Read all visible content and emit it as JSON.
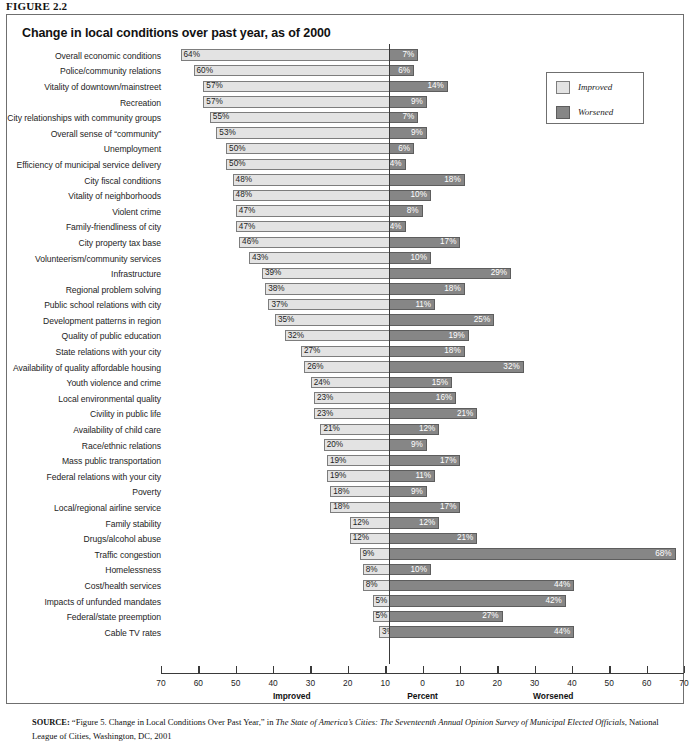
{
  "figure_label": "FIGURE 2.2",
  "chart_title": "Change in local conditions over past year, as of 2000",
  "legend": {
    "improved_label": "Improved",
    "worsened_label": "Worsened",
    "improved_color": "#e3e3e3",
    "worsened_color": "#868686"
  },
  "axis": {
    "ticks": [
      "70",
      "60",
      "50",
      "40",
      "30",
      "20",
      "10",
      "0",
      "10",
      "20",
      "30",
      "40",
      "50",
      "60",
      "70"
    ],
    "left_caption": "Improved",
    "center_caption": "Percent",
    "right_caption": "Worsened",
    "min": -70,
    "max": 70
  },
  "source": {
    "prefix": "SOURCE:",
    "part1": " “Figure 5. Change in Local Conditions Over Past Year,” in ",
    "italic1": "The State of America’s Cities: The Seventeenth Annual Opinion Survey of Municipal Elected Officials",
    "part2": ", National League of Cities, Washington, DC, 2001"
  },
  "chart_data": {
    "type": "bar",
    "title": "Change in local conditions over past year, as of 2000",
    "xlabel": "Percent",
    "ylabel": "",
    "xlim": [
      -70,
      70
    ],
    "grid": false,
    "legend_position": "top-right",
    "orientation": "horizontal",
    "diverging": true,
    "categories": [
      "Overall economic conditions",
      "Police/community relations",
      "Vitality of downtown/mainstreet",
      "Recreation",
      "City relationships with community groups",
      "Overall sense of “community”",
      "Unemployment",
      "Efficiency of municipal service delivery",
      "City fiscal conditions",
      "Vitality of neighborhoods",
      "Violent crime",
      "Family-friendliness of city",
      "City property tax base",
      "Volunteerism/community services",
      "Infrastructure",
      "Regional problem solving",
      "Public school relations with city",
      "Development patterns in region",
      "Quality of public education",
      "State relations with your city",
      "Availability of quality affordable housing",
      "Youth violence and crime",
      "Local environmental quality",
      "Civility in public life",
      "Availability of child care",
      "Race/ethnic relations",
      "Mass public transportation",
      "Federal relations with your city",
      "Poverty",
      "Local/regional airline service",
      "Family stability",
      "Drugs/alcohol abuse",
      "Traffic congestion",
      "Homelessness",
      "Cost/health services",
      "Impacts of unfunded mandates",
      "Federal/state preemption",
      "Cable TV rates"
    ],
    "series": [
      {
        "name": "Improved",
        "values": [
          64,
          60,
          57,
          57,
          55,
          53,
          50,
          50,
          48,
          48,
          47,
          47,
          46,
          43,
          39,
          38,
          37,
          35,
          32,
          27,
          26,
          24,
          23,
          23,
          21,
          20,
          19,
          19,
          18,
          18,
          12,
          12,
          9,
          8,
          8,
          5,
          5,
          3
        ],
        "labels": [
          "64%",
          "60%",
          "57%",
          "57%",
          "55%",
          "53%",
          "50%",
          "50%",
          "48%",
          "48%",
          "47%",
          "47%",
          "46%",
          "43%",
          "39%",
          "38%",
          "37%",
          "35%",
          "32%",
          "27%",
          "26%",
          "24%",
          "23%",
          "23%",
          "21%",
          "20%",
          "19%",
          "19%",
          "18%",
          "18%",
          "12%",
          "12%",
          "9%",
          "8%",
          "8%",
          "5%",
          "5%",
          "3%"
        ]
      },
      {
        "name": "Worsened",
        "values": [
          7,
          6,
          14,
          9,
          7,
          9,
          6,
          4,
          18,
          10,
          8,
          4,
          17,
          10,
          29,
          18,
          11,
          25,
          19,
          18,
          32,
          15,
          16,
          21,
          12,
          9,
          17,
          11,
          9,
          17,
          12,
          21,
          68,
          10,
          44,
          42,
          27,
          44
        ],
        "labels": [
          "7%",
          "6%",
          "14%",
          "9%",
          "7%",
          "9%",
          "6%",
          "4%",
          "18%",
          "10%",
          "8%",
          "4%",
          "17%",
          "10%",
          "29%",
          "18%",
          "11%",
          "25%",
          "19%",
          "18%",
          "32%",
          "15%",
          "16%",
          "21%",
          "12%",
          "9%",
          "17%",
          "11%",
          "9%",
          "17%",
          "12%",
          "21%",
          "68%",
          "10%",
          "44%",
          "42%",
          "27%",
          "44%"
        ]
      }
    ]
  }
}
